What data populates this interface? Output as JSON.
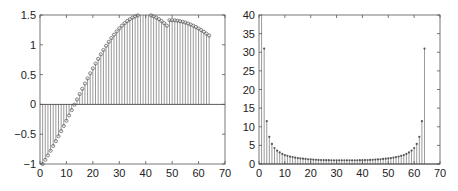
{
  "chart_data": [
    {
      "type": "stem",
      "title": "",
      "xlabel": "",
      "ylabel": "",
      "xlim": [
        0,
        70
      ],
      "ylim": [
        -1,
        1.5
      ],
      "xticks": [
        0,
        10,
        20,
        30,
        40,
        50,
        60,
        70
      ],
      "xtick_labels": [
        "0",
        "10",
        "20",
        "30",
        "40",
        "50",
        "60",
        "70"
      ],
      "yticks": [
        -1,
        -0.5,
        0,
        0.5,
        1,
        1.5
      ],
      "ytick_labels": [
        "−1",
        "−0.5",
        "0",
        "0.5",
        "1",
        "1.5"
      ],
      "grid": false,
      "marker": "circle",
      "baseline": 0,
      "x": [
        1,
        2,
        3,
        4,
        5,
        6,
        7,
        8,
        9,
        10,
        11,
        12,
        13,
        14,
        15,
        16,
        17,
        18,
        19,
        20,
        21,
        22,
        23,
        24,
        25,
        26,
        27,
        28,
        29,
        30,
        31,
        32,
        33,
        34,
        35,
        36,
        37,
        38,
        39,
        40,
        41,
        42,
        43,
        44,
        45,
        46,
        47,
        48,
        49,
        50,
        51,
        52,
        53,
        54,
        55,
        56,
        57,
        58,
        59,
        60,
        61,
        62,
        63,
        64
      ],
      "values": [
        -1.0,
        -0.929,
        -0.855,
        -0.778,
        -0.698,
        -0.617,
        -0.533,
        -0.448,
        -0.362,
        -0.274,
        -0.185,
        -0.096,
        -0.006,
        0.084,
        0.173,
        0.262,
        0.35,
        0.436,
        0.521,
        0.604,
        0.685,
        0.764,
        0.84,
        0.913,
        0.983,
        1.049,
        1.112,
        1.17,
        1.225,
        1.275,
        1.321,
        1.362,
        1.398,
        1.43,
        1.456,
        1.477,
        1.493,
        1.503,
        1.509,
        1.509,
        1.503,
        1.493,
        1.477,
        1.456,
        1.43,
        1.398,
        1.362,
        1.321,
        1.414,
        1.413,
        1.41,
        1.404,
        1.396,
        1.386,
        1.373,
        1.358,
        1.34,
        1.32,
        1.298,
        1.274,
        1.247,
        1.218,
        1.187,
        1.155
      ]
    },
    {
      "type": "stem",
      "title": "",
      "xlabel": "",
      "ylabel": "",
      "xlim": [
        0,
        70
      ],
      "ylim": [
        0,
        40
      ],
      "xticks": [
        0,
        10,
        20,
        30,
        40,
        50,
        60,
        70
      ],
      "xtick_labels": [
        "0",
        "10",
        "20",
        "30",
        "40",
        "50",
        "60",
        "70"
      ],
      "yticks": [
        0,
        5,
        10,
        15,
        20,
        25,
        30,
        35,
        40
      ],
      "ytick_labels": [
        "0",
        "5",
        "10",
        "15",
        "20",
        "25",
        "30",
        "35",
        "40"
      ],
      "grid": false,
      "marker": "dot",
      "baseline": 0,
      "x": [
        1,
        2,
        3,
        4,
        5,
        6,
        7,
        8,
        9,
        10,
        11,
        12,
        13,
        14,
        15,
        16,
        17,
        18,
        19,
        20,
        21,
        22,
        23,
        24,
        25,
        26,
        27,
        28,
        29,
        30,
        31,
        32,
        33,
        34,
        35,
        36,
        37,
        38,
        39,
        40,
        41,
        42,
        43,
        44,
        45,
        46,
        47,
        48,
        49,
        50,
        51,
        52,
        53,
        54,
        55,
        56,
        57,
        58,
        59,
        60,
        61,
        62,
        63,
        64
      ],
      "values": [
        45,
        31,
        11.5,
        7.3,
        5.4,
        4.3,
        3.6,
        3.1,
        2.7,
        2.4,
        2.2,
        2.0,
        1.85,
        1.7,
        1.6,
        1.5,
        1.42,
        1.35,
        1.28,
        1.23,
        1.18,
        1.14,
        1.1,
        1.07,
        1.05,
        1.03,
        1.02,
        1.01,
        1.0,
        1.0,
        1.0,
        1.0,
        1.0,
        1.0,
        1.0,
        1.0,
        1.0,
        1.01,
        1.02,
        1.03,
        1.05,
        1.07,
        1.1,
        1.14,
        1.18,
        1.23,
        1.28,
        1.35,
        1.42,
        1.5,
        1.6,
        1.7,
        1.85,
        2.0,
        2.2,
        2.4,
        2.7,
        3.1,
        3.6,
        4.3,
        5.4,
        7.3,
        11.5,
        31
      ]
    }
  ],
  "layout": {
    "panels": [
      {
        "left": 40,
        "top": 15,
        "right": 225,
        "bottom": 164
      },
      {
        "left": 259,
        "top": 15,
        "right": 440,
        "bottom": 164
      }
    ]
  }
}
